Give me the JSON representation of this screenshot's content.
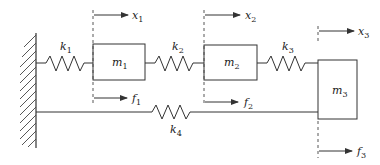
{
  "diagram": {
    "type": "mass-spring system",
    "masses": [
      {
        "id": "m1",
        "base": "m",
        "sub": "1"
      },
      {
        "id": "m2",
        "base": "m",
        "sub": "2"
      },
      {
        "id": "m3",
        "base": "m",
        "sub": "3"
      }
    ],
    "springs": [
      {
        "id": "k1",
        "base": "k",
        "sub": "1",
        "connects": [
          "wall",
          "m1"
        ]
      },
      {
        "id": "k2",
        "base": "k",
        "sub": "2",
        "connects": [
          "m1",
          "m2"
        ]
      },
      {
        "id": "k3",
        "base": "k",
        "sub": "3",
        "connects": [
          "m2",
          "m3"
        ]
      },
      {
        "id": "k4",
        "base": "k",
        "sub": "4",
        "connects": [
          "wall",
          "m3"
        ]
      }
    ],
    "displacements": [
      {
        "id": "x1",
        "base": "x",
        "sub": "1"
      },
      {
        "id": "x2",
        "base": "x",
        "sub": "2"
      },
      {
        "id": "x3",
        "base": "x",
        "sub": "3"
      }
    ],
    "forces": [
      {
        "id": "f1",
        "base": "f",
        "sub": "1"
      },
      {
        "id": "f2",
        "base": "f",
        "sub": "2"
      },
      {
        "id": "f3",
        "base": "f",
        "sub": "3"
      }
    ],
    "colors": {
      "stroke": "#333333",
      "background": "#ffffff"
    }
  }
}
